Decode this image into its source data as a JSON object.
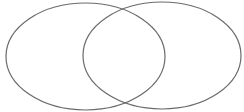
{
  "diagram": {
    "type": "venn",
    "background": "#ffffff",
    "stroke_color": "#6b6b6b",
    "stroke_width": 1.2,
    "sets": [
      {
        "name": "left",
        "cx": 85.5,
        "cy": 56.5,
        "rx": 79.5,
        "ry": 53.5
      },
      {
        "name": "right",
        "cx": 162,
        "cy": 55.5,
        "rx": 79,
        "ry": 53.5
      }
    ]
  }
}
